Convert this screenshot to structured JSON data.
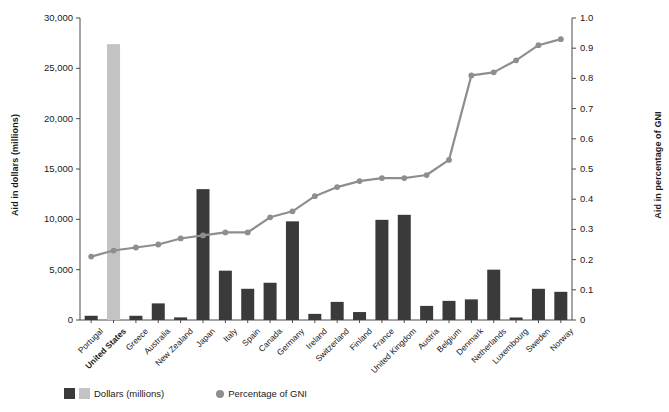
{
  "chart_data": {
    "type": "bar",
    "title": "",
    "xlabel": "",
    "ylabel": "Aid in dollars (millions)",
    "ylabel_right": "Aid in percentage of GNI",
    "ylim": [
      0,
      30000
    ],
    "ylim_right": [
      0,
      1.0
    ],
    "grid": false,
    "legend_position": "bottom-left",
    "categories": [
      "Portugal",
      "United States",
      "Greece",
      "Australia",
      "New Zealand",
      "Japan",
      "Italy",
      "Spain",
      "Canada",
      "Germany",
      "Ireland",
      "Switzerland",
      "Finland",
      "France",
      "United Kingdom",
      "Austria",
      "Belgium",
      "Denmark",
      "Netherlands",
      "Luxembourg",
      "Sweden",
      "Norway"
    ],
    "highlight_category": "United States",
    "series": [
      {
        "name": "Dollars (millions)",
        "type": "bar",
        "axis": "left",
        "color": "#3a3a3a",
        "highlight_color": "#c3c3c3",
        "values": [
          420,
          27400,
          420,
          1650,
          260,
          13000,
          4900,
          3100,
          3700,
          9800,
          610,
          1800,
          790,
          9950,
          10450,
          1400,
          1900,
          2050,
          5000,
          250,
          3100,
          2800
        ]
      },
      {
        "name": "Percentage of GNI",
        "type": "line",
        "axis": "right",
        "color": "#8e8e8e",
        "values": [
          0.21,
          0.23,
          0.24,
          0.25,
          0.27,
          0.28,
          0.29,
          0.29,
          0.34,
          0.36,
          0.41,
          0.44,
          0.46,
          0.47,
          0.47,
          0.48,
          0.53,
          0.81,
          0.82,
          0.86,
          0.91,
          0.93
        ]
      }
    ],
    "left_ticks": [
      "0",
      "5,000",
      "10,000",
      "15,000",
      "20,000",
      "25,000",
      "30,000"
    ],
    "left_tick_values": [
      0,
      5000,
      10000,
      15000,
      20000,
      25000,
      30000
    ],
    "right_ticks": [
      "0",
      "0.1",
      "0.2",
      "0.3",
      "0.4",
      "0.5",
      "0.6",
      "0.7",
      "0.8",
      "0.9",
      "1.0"
    ],
    "right_tick_values": [
      0,
      0.1,
      0.2,
      0.3,
      0.4,
      0.5,
      0.6,
      0.7,
      0.8,
      0.9,
      1.0
    ]
  },
  "legend": {
    "bar_label": "Dollars (millions)",
    "line_label": "Percentage of GNI",
    "bar_color_dark": "#3a3a3a",
    "bar_color_light": "#c3c3c3",
    "line_color": "#8e8e8e"
  },
  "colors": {
    "axis": "#4a4a4a",
    "text": "#1a1a1a",
    "background": "#ffffff"
  }
}
